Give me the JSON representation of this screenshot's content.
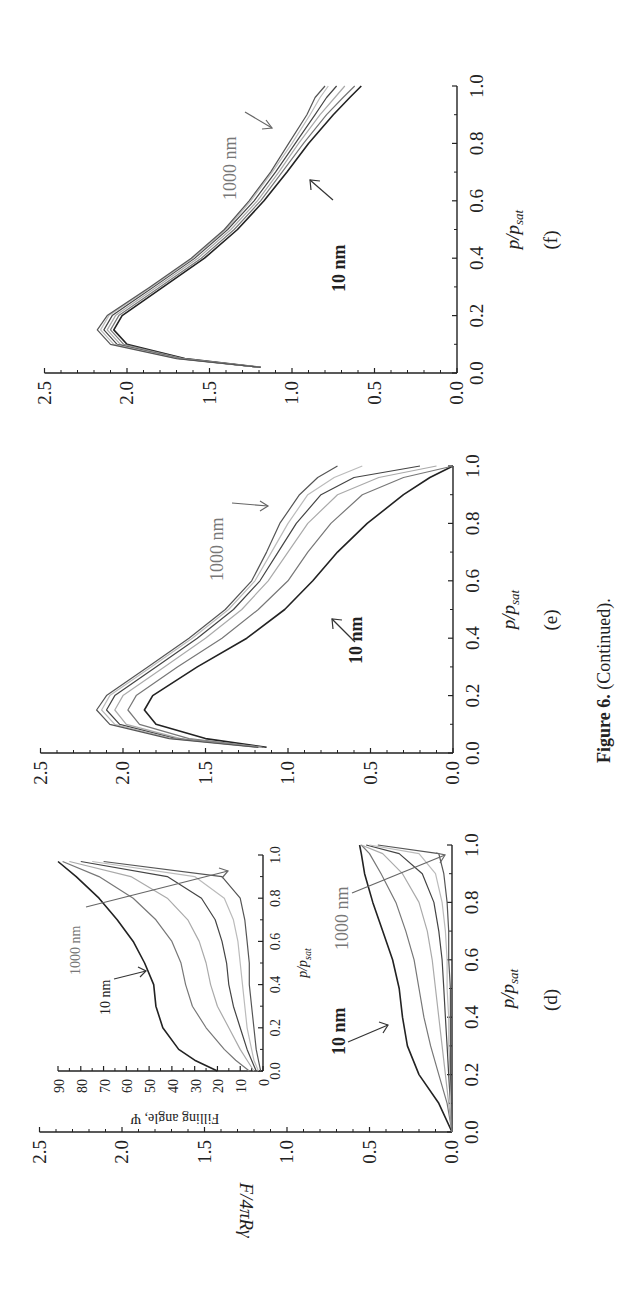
{
  "caption": {
    "bold": "Figure 6.",
    "rest": " (Continued)."
  },
  "axes": {
    "x_title": "p/p",
    "x_title_sub": "sat",
    "y_title": "F/4πRγ",
    "inset_y_title": "Filling angle, Ψ",
    "x_ticks": [
      "0.0",
      "0.2",
      "0.4",
      "0.6",
      "0.8",
      "1.0"
    ],
    "y_ticks": [
      "0.0",
      "0.5",
      "1.0",
      "1.5",
      "2.0",
      "2.5"
    ],
    "inset_y_ticks": [
      "0",
      "10",
      "20",
      "30",
      "40",
      "50",
      "60",
      "70",
      "80",
      "90"
    ]
  },
  "panels": {
    "d": {
      "label": "(d)",
      "annot_small": "10 nm",
      "annot_large": "1000 nm",
      "inset_annot_small": "10 nm",
      "inset_annot_large": "1000 nm"
    },
    "e": {
      "label": "(e)",
      "annot_small": "10 nm",
      "annot_large": "1000 nm"
    },
    "f": {
      "label": "(f)",
      "annot_small": "10 nm",
      "annot_large": "1000 nm"
    }
  },
  "chart_data": [
    {
      "type": "line",
      "panel": "(d)",
      "title": "",
      "xlabel": "p/p_sat",
      "ylabel": "F/4πRγ",
      "xlim": [
        0,
        1.0
      ],
      "ylim": [
        0,
        2.5
      ],
      "x": [
        0.0,
        0.1,
        0.2,
        0.3,
        0.4,
        0.5,
        0.6,
        0.7,
        0.8,
        0.9,
        0.97,
        1.0
      ],
      "series": [
        {
          "name": "10 nm",
          "color": "#222222",
          "values": [
            0.0,
            0.08,
            0.2,
            0.27,
            0.3,
            0.32,
            0.36,
            0.42,
            0.48,
            0.53,
            0.55,
            0.56
          ]
        },
        {
          "name": "r2",
          "color": "#777777",
          "values": [
            0.0,
            0.03,
            0.08,
            0.13,
            0.17,
            0.2,
            0.23,
            0.28,
            0.34,
            0.43,
            0.5,
            0.55
          ]
        },
        {
          "name": "r3",
          "color": "#aaaaaa",
          "values": [
            0.0,
            0.02,
            0.04,
            0.06,
            0.08,
            0.1,
            0.12,
            0.15,
            0.2,
            0.3,
            0.42,
            0.55
          ]
        },
        {
          "name": "r4",
          "color": "#444444",
          "values": [
            0.0,
            0.01,
            0.02,
            0.03,
            0.04,
            0.05,
            0.06,
            0.08,
            0.11,
            0.18,
            0.32,
            0.52
          ]
        },
        {
          "name": "r5",
          "color": "#bbbbbb",
          "values": [
            0.0,
            0.01,
            0.01,
            0.02,
            0.02,
            0.03,
            0.03,
            0.04,
            0.06,
            0.1,
            0.2,
            0.5
          ]
        },
        {
          "name": "1000 nm",
          "color": "#555555",
          "values": [
            0.0,
            0.0,
            0.01,
            0.01,
            0.01,
            0.01,
            0.02,
            0.02,
            0.03,
            0.05,
            0.08,
            0.45
          ]
        }
      ],
      "annotations": [
        "10 nm",
        "1000 nm"
      ],
      "inset": {
        "type": "line",
        "xlabel": "p/p_sat",
        "ylabel": "Filling angle, Ψ",
        "xlim": [
          0,
          1.0
        ],
        "ylim": [
          0,
          90
        ],
        "x": [
          0.0,
          0.05,
          0.1,
          0.2,
          0.3,
          0.4,
          0.5,
          0.6,
          0.7,
          0.8,
          0.9,
          0.97
        ],
        "series": [
          {
            "name": "10 nm",
            "color": "#222222",
            "values": [
              20,
              30,
              37,
              44,
              47,
              48,
              52,
              57,
              64,
              72,
              82,
              90
            ]
          },
          {
            "name": "r2",
            "color": "#777777",
            "values": [
              6,
              12,
              17,
              25,
              31,
              34,
              36,
              40,
              47,
              57,
              72,
              88
            ]
          },
          {
            "name": "r3",
            "color": "#aaaaaa",
            "values": [
              4,
              7,
              10,
              15,
              20,
              23,
              25,
              28,
              33,
              42,
              58,
              85
            ]
          },
          {
            "name": "r4",
            "color": "#444444",
            "values": [
              3,
              5,
              7,
              10,
              13,
              15,
              16,
              18,
              21,
              27,
              42,
              80
            ]
          },
          {
            "name": "r5",
            "color": "#bbbbbb",
            "values": [
              2,
              4,
              5,
              7,
              8,
              9,
              10,
              11,
              13,
              17,
              30,
              75
            ]
          },
          {
            "name": "1000 nm",
            "color": "#555555",
            "values": [
              1,
              2,
              3,
              4,
              5,
              6,
              6,
              7,
              8,
              10,
              18,
              70
            ]
          }
        ]
      }
    },
    {
      "type": "line",
      "panel": "(e)",
      "title": "",
      "xlabel": "p/p_sat",
      "ylabel": "F/4πRγ",
      "xlim": [
        0,
        1.0
      ],
      "ylim": [
        0,
        2.5
      ],
      "x": [
        0.02,
        0.05,
        0.1,
        0.15,
        0.2,
        0.3,
        0.4,
        0.5,
        0.6,
        0.7,
        0.8,
        0.9,
        0.96,
        1.0
      ],
      "series": [
        {
          "name": "10 nm",
          "color": "#222222",
          "values": [
            1.13,
            1.5,
            1.8,
            1.87,
            1.82,
            1.55,
            1.25,
            1.02,
            0.85,
            0.7,
            0.52,
            0.3,
            0.14,
            0.0
          ]
        },
        {
          "name": "r2",
          "color": "#777777",
          "values": [
            1.15,
            1.6,
            1.9,
            1.97,
            1.92,
            1.67,
            1.4,
            1.18,
            1.0,
            0.88,
            0.74,
            0.55,
            0.3,
            0.0
          ]
        },
        {
          "name": "r3",
          "color": "#aaaaaa",
          "values": [
            1.16,
            1.65,
            1.98,
            2.05,
            2.0,
            1.75,
            1.5,
            1.28,
            1.12,
            1.0,
            0.88,
            0.7,
            0.45,
            0.1
          ]
        },
        {
          "name": "r4",
          "color": "#444444",
          "values": [
            1.17,
            1.68,
            2.02,
            2.1,
            2.05,
            1.8,
            1.55,
            1.33,
            1.17,
            1.06,
            0.95,
            0.8,
            0.6,
            0.2
          ]
        },
        {
          "name": "r5",
          "color": "#bbbbbb",
          "values": [
            1.17,
            1.7,
            2.05,
            2.13,
            2.08,
            1.83,
            1.58,
            1.36,
            1.2,
            1.1,
            1.0,
            0.88,
            0.72,
            0.55
          ]
        },
        {
          "name": "1000 nm",
          "color": "#555555",
          "values": [
            1.18,
            1.72,
            2.08,
            2.16,
            2.1,
            1.85,
            1.6,
            1.38,
            1.22,
            1.13,
            1.05,
            0.93,
            0.82,
            0.7
          ]
        }
      ],
      "annotations": [
        "10 nm",
        "1000 nm"
      ]
    },
    {
      "type": "line",
      "panel": "(f)",
      "title": "",
      "xlabel": "p/p_sat",
      "ylabel": "F/4πRγ",
      "xlim": [
        0,
        1.0
      ],
      "ylim": [
        0,
        2.5
      ],
      "x": [
        0.02,
        0.05,
        0.1,
        0.15,
        0.2,
        0.3,
        0.4,
        0.5,
        0.6,
        0.7,
        0.8,
        0.9,
        0.96,
        1.0
      ],
      "series": [
        {
          "name": "10 nm",
          "color": "#222222",
          "values": [
            1.19,
            1.65,
            2.0,
            2.08,
            2.03,
            1.78,
            1.53,
            1.33,
            1.17,
            1.03,
            0.9,
            0.75,
            0.65,
            0.58
          ]
        },
        {
          "name": "r2",
          "color": "#777777",
          "values": [
            1.19,
            1.66,
            2.02,
            2.1,
            2.05,
            1.8,
            1.55,
            1.35,
            1.19,
            1.06,
            0.93,
            0.79,
            0.69,
            0.62
          ]
        },
        {
          "name": "r3",
          "color": "#aaaaaa",
          "values": [
            1.19,
            1.67,
            2.04,
            2.12,
            2.07,
            1.82,
            1.57,
            1.37,
            1.21,
            1.08,
            0.96,
            0.83,
            0.74,
            0.68
          ]
        },
        {
          "name": "r4",
          "color": "#444444",
          "values": [
            1.19,
            1.68,
            2.06,
            2.14,
            2.09,
            1.84,
            1.59,
            1.39,
            1.23,
            1.1,
            0.98,
            0.86,
            0.79,
            0.73
          ]
        },
        {
          "name": "r5",
          "color": "#bbbbbb",
          "values": [
            1.19,
            1.69,
            2.08,
            2.16,
            2.11,
            1.85,
            1.6,
            1.4,
            1.25,
            1.12,
            1.0,
            0.89,
            0.83,
            0.78
          ]
        },
        {
          "name": "1000 nm",
          "color": "#555555",
          "values": [
            1.19,
            1.7,
            2.1,
            2.18,
            2.12,
            1.86,
            1.61,
            1.41,
            1.26,
            1.13,
            1.02,
            0.91,
            0.86,
            0.8
          ]
        }
      ],
      "annotations": [
        "10 nm",
        "1000 nm"
      ]
    }
  ]
}
